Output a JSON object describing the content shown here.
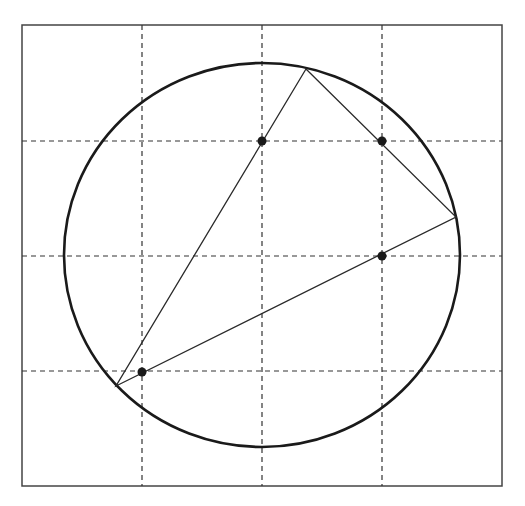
{
  "diagram": {
    "type": "geometry-figure",
    "colors": {
      "background": "#ffffff",
      "stroke": "#1a1a1a",
      "frame": "#444444",
      "grid": "#333333"
    },
    "frame": {
      "x": 22,
      "y": 25,
      "width": 480,
      "height": 461
    },
    "grid": {
      "vertical_x": [
        142,
        262,
        382
      ],
      "horizontal_y": [
        141,
        256,
        371
      ]
    },
    "circle": {
      "cx": 262,
      "cy": 255,
      "rx": 198,
      "ry": 192
    },
    "triangle": {
      "vertices": [
        {
          "name": "top",
          "x": 306,
          "y": 69
        },
        {
          "name": "right",
          "x": 456,
          "y": 217
        },
        {
          "name": "bottom-left",
          "x": 116,
          "y": 386
        }
      ]
    },
    "points": [
      {
        "name": "point-1",
        "x": 262,
        "y": 141
      },
      {
        "name": "point-2",
        "x": 382,
        "y": 141
      },
      {
        "name": "point-3",
        "x": 382,
        "y": 256
      },
      {
        "name": "point-4",
        "x": 142,
        "y": 372
      }
    ]
  }
}
